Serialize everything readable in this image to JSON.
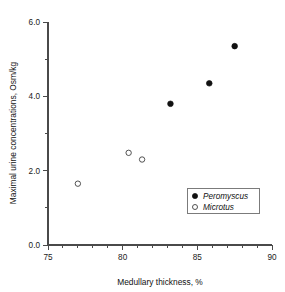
{
  "chart_data": {
    "type": "scatter",
    "title": "",
    "xlabel": "Medullary thickness, %",
    "ylabel": "Maximal urine concentrations, Osm/kg",
    "xlim": [
      75,
      90
    ],
    "ylim": [
      0.0,
      6.0
    ],
    "grid": false,
    "legend_position": "inside-lower-right",
    "x_ticks_major": [
      "75",
      "80",
      "85",
      "90"
    ],
    "x_ticks_major_values": [
      75,
      80,
      85,
      90
    ],
    "x_minor_tick_step": 1,
    "y_ticks_major": [
      "0.0",
      "2.0",
      "4.0",
      "6.0"
    ],
    "y_ticks_major_values": [
      0.0,
      2.0,
      4.0,
      6.0
    ],
    "y_minor_tick_values": [
      1.0,
      3.0,
      5.0
    ],
    "series": [
      {
        "name": "Peromyscus",
        "marker": "filled-circle",
        "color": "#111111",
        "points": [
          {
            "x": 83.2,
            "y": 3.8
          },
          {
            "x": 85.8,
            "y": 4.35
          },
          {
            "x": 87.5,
            "y": 5.35
          }
        ]
      },
      {
        "name": "Microtus",
        "marker": "open-circle",
        "color": "#3f3f3f",
        "points": [
          {
            "x": 77.0,
            "y": 1.65
          },
          {
            "x": 80.4,
            "y": 2.48
          },
          {
            "x": 81.3,
            "y": 2.3
          }
        ]
      }
    ],
    "legend": [
      {
        "label": "Peromyscus",
        "marker": "filled-circle"
      },
      {
        "label": "Microtus",
        "marker": "open-circle"
      }
    ]
  }
}
